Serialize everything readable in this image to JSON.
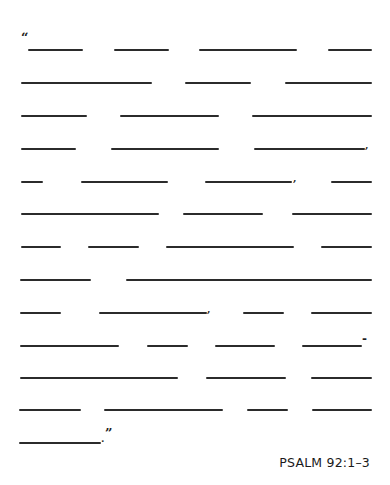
{
  "worksheet": {
    "line_color": "#2b2b2b",
    "opening_quote": "“",
    "closing_quote": "”",
    "reference": "PSALM 92:1–3",
    "rows": [
      {
        "y": 50,
        "blanks": [
          [
            28,
            83
          ],
          [
            114,
            169
          ],
          [
            199,
            297
          ],
          [
            328,
            372
          ]
        ]
      },
      {
        "y": 83,
        "blanks": [
          [
            21,
            152
          ],
          [
            185,
            251
          ],
          [
            285,
            372
          ]
        ]
      },
      {
        "y": 116,
        "blanks": [
          [
            21,
            87
          ],
          [
            120,
            219
          ],
          [
            252,
            372
          ]
        ]
      },
      {
        "y": 149,
        "blanks": [
          [
            21,
            76
          ],
          [
            111,
            219
          ],
          [
            254,
            365
          ]
        ]
      },
      {
        "y": 182,
        "blanks": [
          [
            21,
            43
          ],
          [
            81,
            168
          ],
          [
            205,
            292
          ],
          [
            331,
            372
          ]
        ]
      },
      {
        "y": 214,
        "blanks": [
          [
            21,
            159
          ],
          [
            183,
            263
          ],
          [
            292,
            372
          ]
        ]
      },
      {
        "y": 247,
        "blanks": [
          [
            21,
            61
          ],
          [
            88,
            139
          ],
          [
            166,
            294
          ],
          [
            321,
            372
          ]
        ]
      },
      {
        "y": 280,
        "blanks": [
          [
            20,
            91
          ],
          [
            126,
            372
          ]
        ]
      },
      {
        "y": 313,
        "blanks": [
          [
            20,
            61
          ],
          [
            99,
            207
          ],
          [
            243,
            284
          ],
          [
            311,
            372
          ]
        ]
      },
      {
        "y": 346,
        "blanks": [
          [
            20,
            119
          ],
          [
            147,
            188
          ],
          [
            215,
            275
          ],
          [
            302,
            362
          ]
        ]
      },
      {
        "y": 378,
        "blanks": [
          [
            20,
            178
          ],
          [
            206,
            286
          ],
          [
            311,
            372
          ]
        ]
      },
      {
        "y": 410,
        "blanks": [
          [
            19,
            81
          ],
          [
            104,
            223
          ],
          [
            247,
            288
          ],
          [
            312,
            372
          ]
        ]
      },
      {
        "y": 443,
        "blanks": [
          [
            19,
            101
          ]
        ]
      }
    ],
    "punctuation": [
      {
        "char": "“",
        "x": 21,
        "y": 31,
        "size": 13,
        "label": "opening-quote"
      },
      {
        "char": ",",
        "x": 365,
        "y": 140,
        "size": 10,
        "label": "comma"
      },
      {
        "char": ",",
        "x": 293,
        "y": 173,
        "size": 10,
        "label": "comma"
      },
      {
        "char": ",",
        "x": 207,
        "y": 304,
        "size": 10,
        "label": "comma"
      },
      {
        "char": "-",
        "x": 362,
        "y": 333,
        "size": 12,
        "label": "hyphen"
      },
      {
        "char": ".",
        "x": 101,
        "y": 434,
        "size": 10,
        "label": "period"
      },
      {
        "char": "”",
        "x": 105,
        "y": 427,
        "size": 13,
        "label": "closing-quote"
      }
    ]
  }
}
